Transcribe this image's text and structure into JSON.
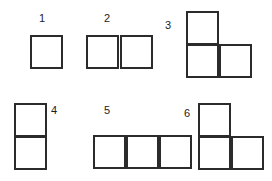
{
  "diagram": {
    "background_color": "#ffffff",
    "stroke_color": "#2b2b2b",
    "label_color": "#1c1c1c",
    "figures": [
      {
        "id": "figure-1",
        "label": "1",
        "label_position": "above",
        "square_count": 1,
        "shape": "single square",
        "squares": [
          {
            "row": 0,
            "col": 0
          }
        ]
      },
      {
        "id": "figure-2",
        "label": "2",
        "label_position": "above",
        "square_count": 2,
        "shape": "two squares side by side (horizontal domino)",
        "squares": [
          {
            "row": 0,
            "col": 0
          },
          {
            "row": 0,
            "col": 1
          }
        ]
      },
      {
        "id": "figure-3",
        "label": "3",
        "label_position": "left",
        "square_count": 3,
        "shape": "L-tromino, top square above left of two bottom squares",
        "squares": [
          {
            "row": 0,
            "col": 0
          },
          {
            "row": 1,
            "col": 0
          },
          {
            "row": 1,
            "col": 1
          }
        ]
      },
      {
        "id": "figure-4",
        "label": "4",
        "label_position": "right",
        "square_count": 2,
        "shape": "two squares stacked vertically (vertical domino)",
        "squares": [
          {
            "row": 0,
            "col": 0
          },
          {
            "row": 1,
            "col": 0
          }
        ]
      },
      {
        "id": "figure-5",
        "label": "5",
        "label_position": "above",
        "square_count": 3,
        "shape": "three squares in a horizontal row (I-tromino)",
        "squares": [
          {
            "row": 0,
            "col": 0
          },
          {
            "row": 0,
            "col": 1
          },
          {
            "row": 0,
            "col": 2
          }
        ]
      },
      {
        "id": "figure-6",
        "label": "6",
        "label_position": "left",
        "square_count": 3,
        "shape": "L-tromino, top square above left bottom square",
        "squares": [
          {
            "row": 0,
            "col": 0
          },
          {
            "row": 1,
            "col": 0
          },
          {
            "row": 1,
            "col": 1
          }
        ]
      }
    ]
  }
}
